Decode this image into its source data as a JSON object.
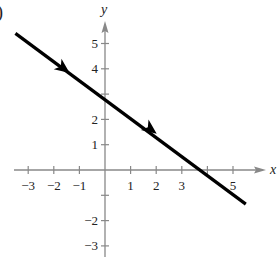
{
  "corner_label": ")",
  "chart_data": {
    "type": "line",
    "title": "",
    "xlabel": "x",
    "ylabel": "y",
    "xlim": [
      -3.5,
      6.2
    ],
    "ylim": [
      -3.5,
      5.8
    ],
    "grid": false,
    "x_ticks": [
      -3,
      -2,
      -1,
      1,
      2,
      3,
      4,
      5
    ],
    "x_tick_labels": [
      "−3",
      "−2",
      "−1",
      "1",
      "2",
      "3",
      "",
      "5"
    ],
    "y_ticks": [
      5,
      4,
      3,
      2,
      1,
      -1,
      -2,
      -3
    ],
    "y_tick_labels": [
      "5",
      "4",
      "",
      "2",
      "1",
      "",
      "−2",
      "−3"
    ],
    "series": [
      {
        "name": "line",
        "color": "#000000",
        "x": [
          -3.5,
          5.5
        ],
        "y": [
          5.4,
          -1.35
        ],
        "direction_arrows": [
          {
            "x": -1.6,
            "y": 4.0
          },
          {
            "x": 1.8,
            "y": 1.6
          }
        ]
      }
    ],
    "annotations": [
      "arrows indicate direction of motion along the line (down-right)"
    ]
  }
}
